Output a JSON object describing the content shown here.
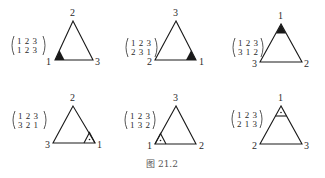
{
  "figure": {
    "caption": "图 21.2",
    "ink_color": "#1a1a1a",
    "background": "#ffffff"
  },
  "panels": [
    {
      "id": "p1",
      "matrix": {
        "top": "1 2 3",
        "bottom": "1 2 3"
      },
      "vertex_labels": {
        "apex": "2",
        "left": "1",
        "right": "3"
      },
      "marker": {
        "corner": "left",
        "style": "filled"
      }
    },
    {
      "id": "p2",
      "matrix": {
        "top": "1 2 3",
        "bottom": "2 3 1"
      },
      "vertex_labels": {
        "apex": "3",
        "left": "2",
        "right": "1"
      },
      "marker": {
        "corner": "right",
        "style": "filled"
      }
    },
    {
      "id": "p3",
      "matrix": {
        "top": "1 2 3",
        "bottom": "3 1 2"
      },
      "vertex_labels": {
        "apex": "1",
        "left": "3",
        "right": "2"
      },
      "marker": {
        "corner": "apex",
        "style": "filled"
      }
    },
    {
      "id": "p4",
      "matrix": {
        "top": "1 2 3",
        "bottom": "3 2 1"
      },
      "vertex_labels": {
        "apex": "2",
        "left": "3",
        "right": "1"
      },
      "marker": {
        "corner": "right",
        "style": "outlined-dot"
      }
    },
    {
      "id": "p5",
      "matrix": {
        "top": "1 2 3",
        "bottom": "1 3 2"
      },
      "vertex_labels": {
        "apex": "3",
        "left": "1",
        "right": "2"
      },
      "marker": {
        "corner": "left",
        "style": "outlined-dot"
      }
    },
    {
      "id": "p6",
      "matrix": {
        "top": "1 2 3",
        "bottom": "2 1 3"
      },
      "vertex_labels": {
        "apex": "1",
        "left": "2",
        "right": "3"
      },
      "marker": {
        "corner": "apex",
        "style": "outlined-dot"
      }
    }
  ]
}
